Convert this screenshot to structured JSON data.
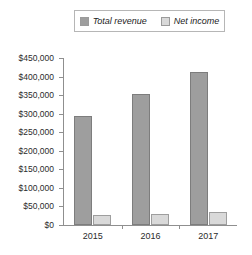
{
  "chart_data": {
    "type": "bar",
    "title": "",
    "subtitle": "",
    "xlabel": "",
    "ylabel": "",
    "categories": [
      "2015",
      "2016",
      "2017"
    ],
    "series": [
      {
        "name": "Total revenue",
        "color": "#9e9e9e",
        "values": [
          295000,
          354000,
          411000
        ]
      },
      {
        "name": "Net income",
        "color": "#d9d9d9",
        "values": [
          27000,
          30000,
          36000
        ]
      }
    ],
    "ylim": [
      0,
      450000
    ],
    "ytick_step": 50000,
    "ytick_labels": [
      "$450,000",
      "$400,000",
      "$350,000",
      "$300,000",
      "$250,000",
      "$200,000",
      "$150,000",
      "$100,000",
      "$50,000",
      "$0"
    ],
    "ytick_values": [
      450000,
      400000,
      350000,
      300000,
      250000,
      200000,
      150000,
      100000,
      50000,
      0
    ],
    "grid": false,
    "legend_position": "top-center"
  },
  "legend": {
    "entries": [
      {
        "label": "Total revenue",
        "swatch": "legend-swatch-total-revenue"
      },
      {
        "label": "Net income",
        "swatch": "legend-swatch-net-income"
      }
    ]
  }
}
